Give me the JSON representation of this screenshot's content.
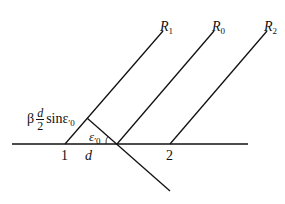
{
  "labels": {
    "r1": {
      "main": "R",
      "sub": "1"
    },
    "r0": {
      "main": "R",
      "sub": "0"
    },
    "r2": {
      "main": "R",
      "sub": "2"
    },
    "point1": "1",
    "point2": "2",
    "d": "d",
    "beta": "β",
    "frac_num": "d",
    "frac_den": "2",
    "sin": "sinε",
    "sin_prime_sub": "′0",
    "angle": "ε",
    "angle_sub": "′0"
  },
  "colors": {
    "line": "#111111",
    "background": "#ffffff"
  }
}
